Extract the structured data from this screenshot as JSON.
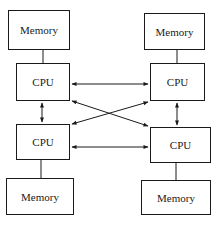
{
  "diagram": {
    "title": "",
    "nodes": [
      {
        "id": "mem-tl",
        "label": "Memory",
        "type": "memory",
        "x": 8,
        "y": 10,
        "w": 62,
        "h": 40
      },
      {
        "id": "cpu-tl",
        "label": "CPU",
        "type": "cpu",
        "x": 16,
        "y": 63,
        "w": 54,
        "h": 38
      },
      {
        "id": "cpu-bl",
        "label": "CPU",
        "type": "cpu",
        "x": 16,
        "y": 124,
        "w": 54,
        "h": 36
      },
      {
        "id": "mem-bl",
        "label": "Memory",
        "type": "memory",
        "x": 6,
        "y": 178,
        "w": 68,
        "h": 37
      },
      {
        "id": "mem-tr",
        "label": "Memory",
        "type": "memory",
        "x": 144,
        "y": 13,
        "w": 61,
        "h": 37
      },
      {
        "id": "cpu-tr",
        "label": "CPU",
        "type": "cpu",
        "x": 150,
        "y": 63,
        "w": 55,
        "h": 38
      },
      {
        "id": "cpu-br",
        "label": "CPU",
        "type": "cpu",
        "x": 150,
        "y": 127,
        "w": 61,
        "h": 36
      },
      {
        "id": "mem-br",
        "label": "Memory",
        "type": "memory",
        "x": 141,
        "y": 180,
        "w": 70,
        "h": 35
      }
    ],
    "edges": [
      {
        "from": "mem-tl",
        "to": "cpu-tl",
        "style": "line"
      },
      {
        "from": "mem-tr",
        "to": "cpu-tr",
        "style": "line"
      },
      {
        "from": "cpu-bl",
        "to": "mem-bl",
        "style": "line"
      },
      {
        "from": "cpu-br",
        "to": "mem-br",
        "style": "line"
      },
      {
        "from": "cpu-tl",
        "to": "cpu-tr",
        "style": "bidirectional-arrow"
      },
      {
        "from": "cpu-bl",
        "to": "cpu-br",
        "style": "bidirectional-arrow"
      },
      {
        "from": "cpu-tl",
        "to": "cpu-bl",
        "style": "bidirectional-arrow"
      },
      {
        "from": "cpu-tr",
        "to": "cpu-br",
        "style": "bidirectional-arrow"
      },
      {
        "from": "cpu-tl",
        "to": "cpu-br",
        "style": "bidirectional-arrow"
      },
      {
        "from": "cpu-tr",
        "to": "cpu-bl",
        "style": "bidirectional-arrow"
      }
    ],
    "colors": {
      "stroke": "#1a1a1a",
      "background": "#ffffff"
    }
  }
}
